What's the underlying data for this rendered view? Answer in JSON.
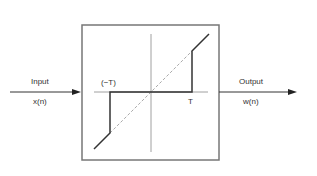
{
  "diagram": {
    "input": {
      "label": "Input",
      "signal": "x(n)"
    },
    "output": {
      "label": "Output",
      "signal": "w(n)"
    },
    "block": {
      "neg_threshold_label": "(−T)",
      "pos_threshold_label": "T",
      "function": "hard-threshold"
    },
    "colors": {
      "line": "#333333",
      "box": "#777777",
      "axis": "#888888",
      "dashed": "#aaaaaa"
    }
  }
}
